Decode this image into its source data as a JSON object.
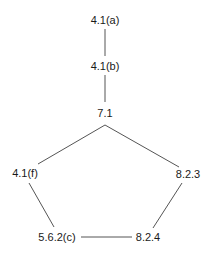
{
  "diagram": {
    "nodes": [
      {
        "id": "n1",
        "label": "4.1(a)",
        "x": 105,
        "y": 20
      },
      {
        "id": "n2",
        "label": "4.1(b)",
        "x": 105,
        "y": 66
      },
      {
        "id": "n3",
        "label": "7.1",
        "x": 105,
        "y": 113
      },
      {
        "id": "n4",
        "label": "4.1(f)",
        "x": 25,
        "y": 173
      },
      {
        "id": "n5",
        "label": "8.2.3",
        "x": 188,
        "y": 174
      },
      {
        "id": "n6",
        "label": "5.6.2(c)",
        "x": 57,
        "y": 237
      },
      {
        "id": "n7",
        "label": "8.2.4",
        "x": 148,
        "y": 237
      }
    ],
    "edges": [
      {
        "from": "4.1(a)",
        "to": "4.1(b)",
        "x1": 105,
        "y1": 29,
        "x2": 105,
        "y2": 56
      },
      {
        "from": "4.1(b)",
        "to": "7.1",
        "x1": 105,
        "y1": 75,
        "x2": 105,
        "y2": 102
      },
      {
        "from": "7.1",
        "to": "4.1(f)",
        "x1": 105,
        "y1": 125,
        "x2": 38,
        "y2": 164
      },
      {
        "from": "7.1",
        "to": "8.2.3",
        "x1": 105,
        "y1": 125,
        "x2": 179,
        "y2": 167
      },
      {
        "from": "4.1(f)",
        "to": "5.6.2(c)",
        "x1": 29,
        "y1": 183,
        "x2": 54,
        "y2": 227
      },
      {
        "from": "8.2.3",
        "to": "8.2.4",
        "x1": 182,
        "y1": 183,
        "x2": 153,
        "y2": 228
      },
      {
        "from": "5.6.2(c)",
        "to": "8.2.4",
        "x1": 81,
        "y1": 237,
        "x2": 132,
        "y2": 237
      }
    ],
    "colors": {
      "line": "#555555",
      "text": "#1a1a1a",
      "background": "#ffffff"
    }
  }
}
